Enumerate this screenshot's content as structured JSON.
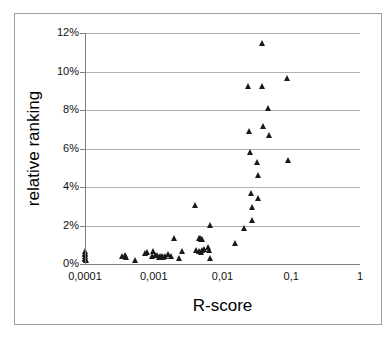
{
  "chart_data": {
    "type": "scatter",
    "title": "",
    "xlabel": "R-score",
    "ylabel": "relative ranking",
    "xscale": "log",
    "yscale": "linear",
    "xlim": [
      0.0001,
      1
    ],
    "ylim": [
      0,
      12
    ],
    "grid": "horizontal",
    "legend": "none",
    "marker": "filled-triangle",
    "marker_color": "#1a1a1a",
    "x_tick_labels": [
      "0,0001",
      "0,001",
      "0,01",
      "0,1",
      "1"
    ],
    "x_tick_values": [
      0.0001,
      0.001,
      0.01,
      0.1,
      1
    ],
    "y_tick_labels": [
      "0%",
      "2%",
      "4%",
      "6%",
      "8%",
      "10%",
      "12%"
    ],
    "y_tick_values": [
      0,
      2,
      4,
      6,
      8,
      10,
      12
    ],
    "y_unit": "%",
    "points": [
      {
        "x": 0.000101,
        "y": 0.5
      },
      {
        "x": 0.000102,
        "y": 0.42
      },
      {
        "x": 0.0001,
        "y": 0.34
      },
      {
        "x": 0.000103,
        "y": 0.26
      },
      {
        "x": 0.000101,
        "y": 0.18
      },
      {
        "x": 0.0001,
        "y": 0.1
      },
      {
        "x": 0.000104,
        "y": 0.05
      },
      {
        "x": 0.000355,
        "y": 0.27
      },
      {
        "x": 0.000385,
        "y": 0.3
      },
      {
        "x": 0.0004,
        "y": 0.2
      },
      {
        "x": 0.00054,
        "y": 0.07
      },
      {
        "x": 0.00076,
        "y": 0.43
      },
      {
        "x": 0.00082,
        "y": 0.47
      },
      {
        "x": 0.00095,
        "y": 0.26
      },
      {
        "x": 0.001,
        "y": 0.52
      },
      {
        "x": 0.00105,
        "y": 0.33
      },
      {
        "x": 0.00115,
        "y": 0.3
      },
      {
        "x": 0.0012,
        "y": 0.22
      },
      {
        "x": 0.00125,
        "y": 0.24
      },
      {
        "x": 0.0013,
        "y": 0.2
      },
      {
        "x": 0.00132,
        "y": 0.28
      },
      {
        "x": 0.0014,
        "y": 0.19
      },
      {
        "x": 0.0015,
        "y": 0.26
      },
      {
        "x": 0.00165,
        "y": 0.34
      },
      {
        "x": 0.0018,
        "y": 0.25
      },
      {
        "x": 0.002,
        "y": 1.18
      },
      {
        "x": 0.00235,
        "y": 0.17
      },
      {
        "x": 0.0026,
        "y": 0.53
      },
      {
        "x": 0.0041,
        "y": 2.9
      },
      {
        "x": 0.0042,
        "y": 0.55
      },
      {
        "x": 0.0046,
        "y": 1.22
      },
      {
        "x": 0.00485,
        "y": 1.22
      },
      {
        "x": 0.005,
        "y": 1.15
      },
      {
        "x": 0.0051,
        "y": 1.14
      },
      {
        "x": 0.0047,
        "y": 0.52
      },
      {
        "x": 0.00495,
        "y": 0.48
      },
      {
        "x": 0.0052,
        "y": 0.56
      },
      {
        "x": 0.0055,
        "y": 0.62
      },
      {
        "x": 0.0062,
        "y": 0.72
      },
      {
        "x": 0.0064,
        "y": 0.55
      },
      {
        "x": 0.0067,
        "y": 1.85
      },
      {
        "x": 0.0068,
        "y": 0.13
      },
      {
        "x": 0.0155,
        "y": 0.95
      },
      {
        "x": 0.021,
        "y": 1.7
      },
      {
        "x": 0.024,
        "y": 9.1
      },
      {
        "x": 0.025,
        "y": 6.75
      },
      {
        "x": 0.0255,
        "y": 5.65
      },
      {
        "x": 0.026,
        "y": 3.55
      },
      {
        "x": 0.027,
        "y": 2.8
      },
      {
        "x": 0.0275,
        "y": 2.15
      },
      {
        "x": 0.032,
        "y": 5.15
      },
      {
        "x": 0.033,
        "y": 4.45
      },
      {
        "x": 0.0335,
        "y": 3.25
      },
      {
        "x": 0.038,
        "y": 11.3
      },
      {
        "x": 0.0385,
        "y": 9.1
      },
      {
        "x": 0.04,
        "y": 7.0
      },
      {
        "x": 0.047,
        "y": 7.95
      },
      {
        "x": 0.048,
        "y": 6.55
      },
      {
        "x": 0.088,
        "y": 9.5
      },
      {
        "x": 0.09,
        "y": 5.25
      }
    ]
  }
}
